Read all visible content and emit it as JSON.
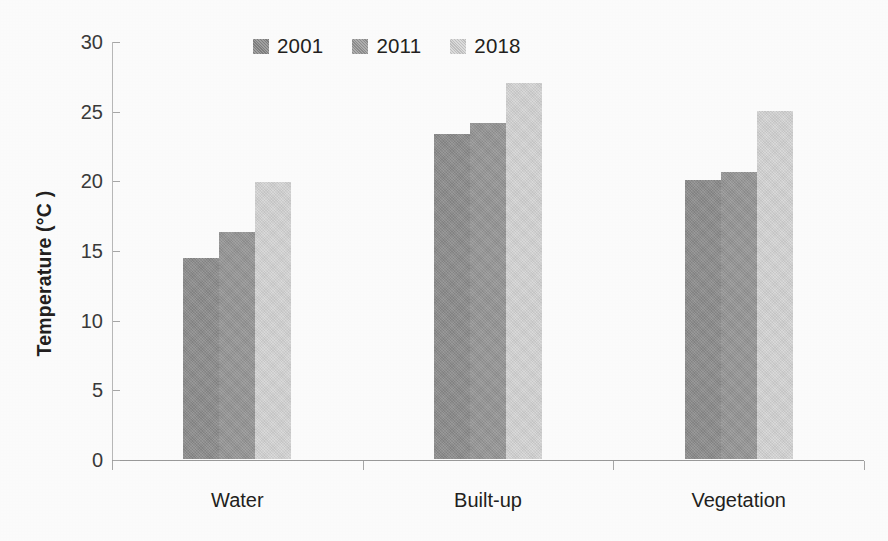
{
  "chart_data": {
    "type": "bar",
    "title": "",
    "subtitle": "",
    "xlabel": "",
    "ylabel": "Temperature (°C )",
    "categories": [
      "Water",
      "Built-up",
      "Vegetation"
    ],
    "series": [
      {
        "name": "2001",
        "color": "#8d8d8d",
        "values": [
          14.4,
          23.3,
          20.0
        ]
      },
      {
        "name": "2011",
        "color": "#979797",
        "values": [
          16.3,
          24.1,
          20.6
        ]
      },
      {
        "name": "2018",
        "color": "#d6d6d6",
        "values": [
          19.9,
          27.0,
          25.0
        ]
      }
    ],
    "ylim": [
      0,
      30
    ],
    "ytick_step": 5,
    "yticks": [
      0,
      5,
      10,
      15,
      20,
      25,
      30
    ],
    "ytick_labels": [
      "0",
      "5",
      "10",
      "15",
      "20",
      "25",
      "30"
    ],
    "grid": false,
    "legend_position": "top-center",
    "legend_entries": [
      "2001",
      "2011",
      "2018"
    ],
    "annotations": []
  }
}
